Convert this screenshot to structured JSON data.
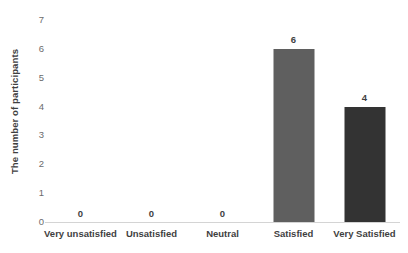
{
  "chart_data": {
    "type": "bar",
    "title": "",
    "subtitle": "",
    "xlabel": "",
    "ylabel": "The number of participants",
    "categories": [
      "Very unsatisfied",
      "Unsatisfied",
      "Neutral",
      "Satisfied",
      "Very Satisfied"
    ],
    "values": [
      0,
      0,
      0,
      6,
      4
    ],
    "value_labels": [
      "0",
      "0",
      "0",
      "6",
      "4"
    ],
    "bar_colors": [
      "#5f5f5f",
      "#5f5f5f",
      "#5f5f5f",
      "#5f5f5f",
      "#333333"
    ],
    "ylim": [
      0,
      7
    ],
    "ytick_values": [
      0,
      1,
      2,
      3,
      4,
      5,
      6,
      7
    ],
    "ytick_labels": [
      "0",
      "1",
      "2",
      "3",
      "4",
      "5",
      "6",
      "7"
    ],
    "grid": false,
    "legend": false,
    "legend_position": "none",
    "background_color": "#ffffff",
    "axis_color": "#d4d4d4",
    "tick_label_color": "#6b6b6b",
    "category_label_color": "#3f3f3f"
  }
}
